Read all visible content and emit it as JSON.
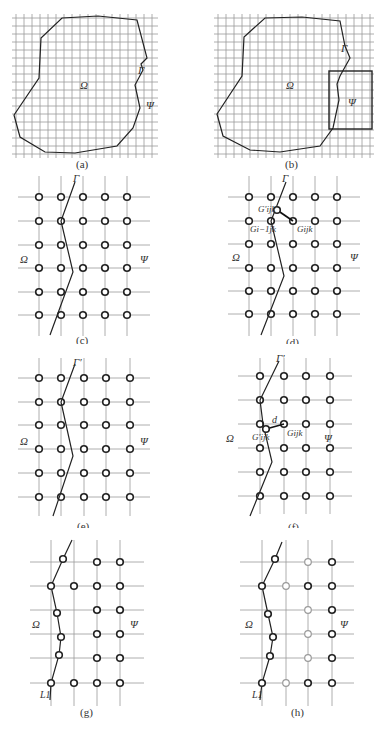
{
  "figure": {
    "panels": [
      {
        "id": "a",
        "caption": "(a)",
        "labels": {
          "omega": "Ω",
          "gamma": "Γ",
          "psi": "Ψ"
        }
      },
      {
        "id": "b",
        "caption": "(b)",
        "labels": {
          "omega": "Ω",
          "gamma": "Γ",
          "psi": "Ψ"
        }
      },
      {
        "id": "c",
        "caption": "(c)",
        "labels": {
          "omega": "Ω",
          "gamma": "Γ",
          "psi": "Ψ"
        }
      },
      {
        "id": "d",
        "caption": "(d)",
        "labels": {
          "omega": "Ω",
          "gamma": "Γ",
          "psi": "Ψ",
          "g_prime": "G′ijk",
          "g_im1": "Gi−1jk",
          "g_ijk": "Gijk"
        }
      },
      {
        "id": "e",
        "caption": "(e)",
        "labels": {
          "omega": "Ω",
          "gamma": "Γ′",
          "psi": "Ψ"
        }
      },
      {
        "id": "f",
        "caption": "(f)",
        "labels": {
          "omega": "Ω",
          "gamma": "Γ′",
          "psi": "Ψ",
          "g_prime": "G′ijk",
          "g_ijk": "Gijk",
          "d": "d"
        }
      },
      {
        "id": "g",
        "caption": "(g)",
        "labels": {
          "omega": "Ω",
          "psi": "Ψ",
          "l1": "L1"
        }
      },
      {
        "id": "h",
        "caption": "(h)",
        "labels": {
          "omega": "Ω",
          "psi": "Ψ",
          "l1": "L1"
        }
      }
    ]
  }
}
